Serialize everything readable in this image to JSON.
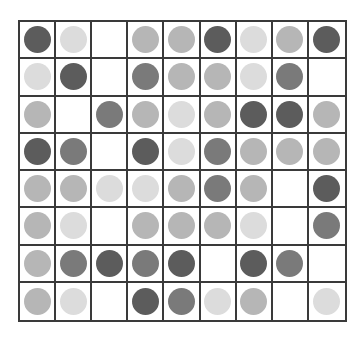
{
  "board": {
    "rows": 8,
    "cols": 9,
    "shade_colors": {
      "dark": "#5c5c5c",
      "medium": "#7a7a7a",
      "light": "#b6b6b6",
      "very_light": "#dcdcdc"
    },
    "grid": [
      [
        "dark",
        "very_light",
        "empty",
        "light",
        "light",
        "dark",
        "very_light",
        "light",
        "dark"
      ],
      [
        "very_light",
        "dark",
        "empty",
        "medium",
        "light",
        "light",
        "very_light",
        "medium",
        "empty"
      ],
      [
        "light",
        "empty",
        "medium",
        "light",
        "very_light",
        "light",
        "dark",
        "dark",
        "light"
      ],
      [
        "dark",
        "medium",
        "empty",
        "dark",
        "very_light",
        "medium",
        "light",
        "light",
        "light"
      ],
      [
        "light",
        "light",
        "very_light",
        "very_light",
        "light",
        "medium",
        "light",
        "empty",
        "dark"
      ],
      [
        "light",
        "very_light",
        "empty",
        "light",
        "light",
        "light",
        "very_light",
        "empty",
        "medium"
      ],
      [
        "light",
        "medium",
        "dark",
        "medium",
        "dark",
        "empty",
        "dark",
        "medium",
        "empty"
      ],
      [
        "light",
        "very_light",
        "empty",
        "dark",
        "medium",
        "very_light",
        "light",
        "empty",
        "very_light"
      ]
    ]
  }
}
